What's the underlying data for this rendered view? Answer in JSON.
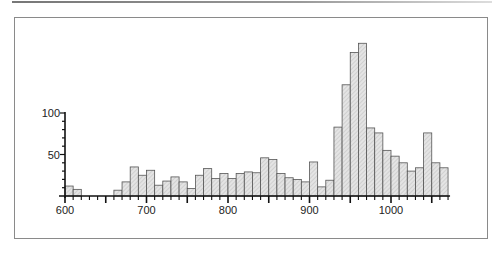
{
  "chart_data": {
    "type": "bar",
    "title": "",
    "xlabel": "",
    "ylabel": "",
    "bin_width": 10,
    "x_start": 600,
    "xlim": [
      600,
      1070
    ],
    "ylim": [
      0,
      185
    ],
    "x_ticks": [
      600,
      700,
      800,
      900,
      1000
    ],
    "y_ticks": [
      50,
      100
    ],
    "grid": false,
    "legend": null,
    "categories": [
      600,
      610,
      620,
      630,
      640,
      650,
      660,
      670,
      680,
      690,
      700,
      710,
      720,
      730,
      740,
      750,
      760,
      770,
      780,
      790,
      800,
      810,
      820,
      830,
      840,
      850,
      860,
      870,
      880,
      890,
      900,
      910,
      920,
      930,
      940,
      950,
      960,
      970,
      980,
      990,
      1000,
      1010,
      1020,
      1030,
      1040,
      1050,
      1060
    ],
    "values": [
      12,
      8,
      0,
      0,
      0,
      0,
      7,
      17,
      35,
      25,
      31,
      13,
      18,
      23,
      17,
      9,
      25,
      33,
      21,
      27,
      21,
      27,
      29,
      28,
      46,
      44,
      27,
      22,
      20,
      17,
      41,
      11,
      19,
      83,
      134,
      173,
      184,
      82,
      76,
      55,
      48,
      40,
      30,
      34,
      76,
      40,
      34
    ]
  },
  "axis_labels": {
    "x": [
      "600",
      "700",
      "800",
      "900",
      "1000"
    ],
    "y": [
      "50",
      "100"
    ]
  }
}
